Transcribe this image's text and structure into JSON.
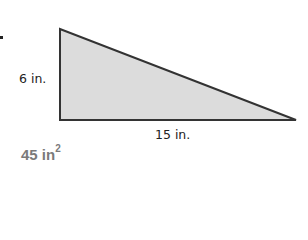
{
  "figure": {
    "shape": "right-triangle",
    "fill_color": "#dcdcdc",
    "stroke_color": "#333333",
    "height_label": "6 in.",
    "base_label": "15 in."
  },
  "answer": {
    "value": "45 in",
    "exponent": "2"
  }
}
